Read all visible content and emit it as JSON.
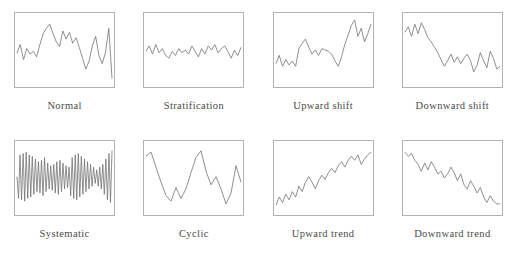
{
  "figure": {
    "title": "",
    "panel_count": 8,
    "columns": 4,
    "rows": 2
  },
  "style": {
    "line_color": "#737373",
    "border_color": "#b2b2b2",
    "background": "#ffffff",
    "caption_color": "#4a4a4a"
  },
  "chart_data": {
    "type": "line",
    "title": "",
    "xlabel": "",
    "ylabel": "",
    "grid": false,
    "legend": "none",
    "axis_ticks": false,
    "xlim": [
      0,
      100
    ],
    "ylim": [
      0,
      100
    ],
    "panels": [
      {
        "id": "normal",
        "label": "Normal",
        "description": "Random variation about the mean",
        "x": [
          0,
          3.4,
          6.9,
          10.3,
          13.8,
          17.2,
          20.7,
          24.1,
          27.6,
          31,
          34.5,
          37.9,
          41.4,
          44.8,
          48.3,
          51.7,
          55.2,
          58.6,
          62.1,
          65.5,
          69,
          72.4,
          75.9,
          79.3,
          82.8,
          86.2,
          89.7,
          93.1,
          96.6,
          100
        ],
        "y": [
          45,
          58,
          36,
          52,
          44,
          48,
          40,
          58,
          74,
          82,
          88,
          74,
          62,
          55,
          78,
          66,
          76,
          60,
          68,
          54,
          38,
          22,
          34,
          56,
          70,
          42,
          30,
          46,
          82,
          8
        ]
      },
      {
        "id": "stratification",
        "label": "Stratification",
        "description": "Low amplitude variation hugging the centre line",
        "x": [
          0,
          3.4,
          6.9,
          10.3,
          13.8,
          17.2,
          20.7,
          24.1,
          27.6,
          31,
          34.5,
          37.9,
          41.4,
          44.8,
          48.3,
          51.7,
          55.2,
          58.6,
          62.1,
          65.5,
          69,
          72.4,
          75.9,
          79.3,
          82.8,
          86.2,
          89.7,
          93.1,
          96.6,
          100
        ],
        "y": [
          48,
          56,
          44,
          58,
          46,
          52,
          42,
          38,
          48,
          42,
          52,
          46,
          50,
          44,
          56,
          48,
          40,
          52,
          44,
          56,
          50,
          58,
          46,
          52,
          56,
          48,
          38,
          50,
          42,
          54
        ]
      },
      {
        "id": "upward-shift",
        "label": "Upward shift",
        "description": "Mean steps up in the second half of the series",
        "x": [
          0,
          3.4,
          6.9,
          10.3,
          13.8,
          17.2,
          20.7,
          24.1,
          27.6,
          31,
          34.5,
          37.9,
          41.4,
          44.8,
          48.3,
          51.7,
          55.2,
          58.6,
          62.1,
          65.5,
          69,
          72.4,
          75.9,
          79.3,
          82.8,
          86.2,
          89.7,
          93.1,
          96.6,
          100
        ],
        "y": [
          30,
          42,
          26,
          36,
          28,
          34,
          26,
          52,
          60,
          66,
          54,
          44,
          50,
          42,
          52,
          50,
          48,
          44,
          34,
          26,
          40,
          58,
          72,
          86,
          94,
          70,
          82,
          62,
          74,
          88
        ]
      },
      {
        "id": "downward-shift",
        "label": "Downward shift",
        "description": "Mean steps down in the second half of the series",
        "x": [
          0,
          3.4,
          6.9,
          10.3,
          13.8,
          17.2,
          20.7,
          24.1,
          27.6,
          31,
          34.5,
          37.9,
          41.4,
          44.8,
          48.3,
          51.7,
          55.2,
          58.6,
          62.1,
          65.5,
          69,
          72.4,
          75.9,
          79.3,
          82.8,
          86.2,
          89.7,
          93.1,
          96.6,
          100
        ],
        "y": [
          76,
          84,
          70,
          88,
          74,
          90,
          80,
          68,
          62,
          54,
          46,
          36,
          26,
          34,
          44,
          32,
          40,
          30,
          38,
          44,
          34,
          18,
          28,
          46,
          34,
          24,
          48,
          38,
          22,
          26
        ]
      },
      {
        "id": "systematic",
        "label": "Systematic",
        "description": "High frequency alternating saw-tooth oscillation",
        "x": [
          0,
          1.6,
          3.2,
          4.8,
          6.5,
          8.1,
          9.7,
          11.3,
          12.9,
          14.5,
          16.1,
          17.7,
          19.4,
          21,
          22.6,
          24.2,
          25.8,
          27.4,
          29,
          30.6,
          32.3,
          33.9,
          35.5,
          37.1,
          38.7,
          40.3,
          41.9,
          43.5,
          45.2,
          46.8,
          48.4,
          50,
          51.6,
          53.2,
          54.8,
          56.5,
          58.1,
          59.7,
          61.3,
          62.9,
          64.5,
          66.1,
          67.7,
          69.4,
          71,
          72.6,
          74.2,
          75.8,
          77.4,
          79,
          80.6,
          82.3,
          83.9,
          85.5,
          87.1,
          88.7,
          90.3,
          91.9,
          93.5,
          95.2,
          96.8,
          98.4,
          100
        ],
        "y": [
          52,
          20,
          84,
          18,
          86,
          16,
          88,
          20,
          84,
          22,
          82,
          26,
          78,
          30,
          74,
          28,
          76,
          24,
          80,
          30,
          72,
          34,
          68,
          32,
          70,
          28,
          74,
          26,
          76,
          30,
          72,
          34,
          68,
          36,
          66,
          24,
          80,
          20,
          84,
          18,
          86,
          22,
          82,
          26,
          78,
          30,
          74,
          34,
          70,
          38,
          66,
          42,
          62,
          38,
          66,
          34,
          70,
          26,
          78,
          18,
          86,
          14,
          90
        ]
      },
      {
        "id": "cyclic",
        "label": "Cyclic",
        "description": "Repeating long wavelength up and down cycles",
        "x": [
          0,
          5.3,
          10.5,
          15.8,
          21.1,
          26.3,
          31.6,
          36.8,
          42.1,
          47.4,
          52.6,
          57.9,
          63.2,
          68.4,
          73.7,
          78.9,
          84.2,
          89.5,
          94.7,
          100
        ],
        "y": [
          82,
          88,
          66,
          44,
          24,
          16,
          36,
          20,
          34,
          58,
          80,
          90,
          60,
          40,
          52,
          34,
          12,
          28,
          68,
          44
        ]
      },
      {
        "id": "upward-trend",
        "label": "Upward trend",
        "description": "Steady increase over the whole series",
        "x": [
          0,
          3.4,
          6.9,
          10.3,
          13.8,
          17.2,
          20.7,
          24.1,
          27.6,
          31,
          34.5,
          37.9,
          41.4,
          44.8,
          48.3,
          51.7,
          55.2,
          58.6,
          62.1,
          65.5,
          69,
          72.4,
          75.9,
          79.3,
          82.8,
          86.2,
          89.7,
          93.1,
          96.6,
          100
        ],
        "y": [
          10,
          22,
          14,
          26,
          18,
          30,
          22,
          38,
          30,
          44,
          52,
          44,
          34,
          46,
          54,
          48,
          58,
          64,
          58,
          68,
          74,
          66,
          76,
          82,
          76,
          84,
          70,
          78,
          84,
          88
        ]
      },
      {
        "id": "downward-trend",
        "label": "Downward trend",
        "description": "Steady decrease over the whole series",
        "x": [
          0,
          3.4,
          6.9,
          10.3,
          13.8,
          17.2,
          20.7,
          24.1,
          27.6,
          31,
          34.5,
          37.9,
          41.4,
          44.8,
          48.3,
          51.7,
          55.2,
          58.6,
          62.1,
          65.5,
          69,
          72.4,
          75.9,
          79.3,
          82.8,
          86.2,
          89.7,
          93.1,
          96.6,
          100
        ],
        "y": [
          88,
          82,
          86,
          76,
          70,
          60,
          72,
          62,
          74,
          66,
          56,
          60,
          50,
          56,
          66,
          58,
          46,
          56,
          40,
          34,
          46,
          38,
          28,
          36,
          22,
          14,
          24,
          16,
          12,
          12
        ]
      }
    ]
  }
}
